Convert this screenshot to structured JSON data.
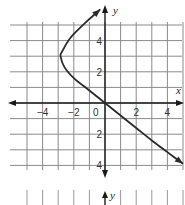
{
  "chart_data": {
    "type": "line",
    "title": "",
    "xlabel": "x",
    "ylabel": "y",
    "xlim": [
      -5.5,
      5
    ],
    "ylim": [
      -4.5,
      6
    ],
    "grid": true,
    "x_ticks": [
      {
        "value": -4,
        "label": "−4"
      },
      {
        "value": -2,
        "label": "−2"
      },
      {
        "value": 0,
        "label": "0"
      },
      {
        "value": 2,
        "label": "2"
      },
      {
        "value": 4,
        "label": "4"
      }
    ],
    "y_ticks": [
      {
        "value": 4,
        "label": "4"
      },
      {
        "value": 2,
        "label": "2"
      },
      {
        "value": -2,
        "label": "2"
      },
      {
        "value": -4,
        "label": "4"
      }
    ],
    "series": [
      {
        "name": "curve",
        "points": [
          [
            -0.3,
            6.0
          ],
          [
            -1.2,
            5.2
          ],
          [
            -2.2,
            4.2
          ],
          [
            -2.75,
            3.3
          ],
          [
            -2.85,
            3.0
          ],
          [
            -2.6,
            2.3
          ],
          [
            -2.0,
            1.6
          ],
          [
            -1.0,
            0.8
          ],
          [
            0,
            0
          ],
          [
            1,
            -0.8
          ],
          [
            2,
            -1.6
          ],
          [
            3,
            -2.4
          ],
          [
            4,
            -3.15
          ],
          [
            5,
            -3.9
          ]
        ],
        "arrow_start": true,
        "arrow_end": true
      }
    ],
    "annotations": [
      {
        "text": "y",
        "note": "second axis label at bottom (cropped next figure)"
      }
    ]
  },
  "labels": {
    "x_axis": "x",
    "y_axis": "y",
    "y_axis_bottom": "y",
    "origin": "0"
  }
}
